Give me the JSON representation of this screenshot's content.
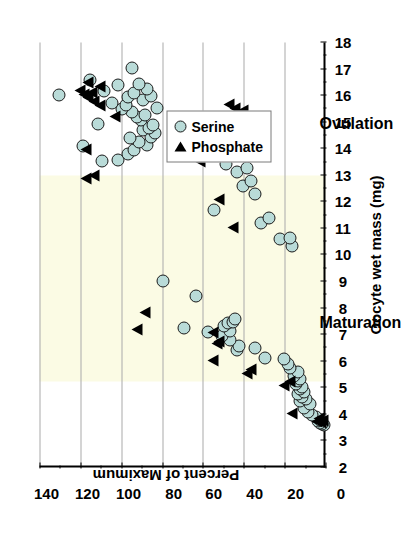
{
  "chart_data": {
    "type": "scatter",
    "title": "",
    "xlabel": "Oocyte wet mass (mg)",
    "ylabel": "Percent of Maximum",
    "xlim": [
      2,
      18
    ],
    "ylim": [
      0,
      140
    ],
    "xticks": [
      2,
      3,
      4,
      5,
      6,
      7,
      8,
      9,
      10,
      11,
      12,
      13,
      14,
      15,
      16,
      17,
      18
    ],
    "yticks": [
      0,
      20,
      40,
      60,
      80,
      100,
      120,
      140
    ],
    "xtick_labels": [
      "2",
      "3",
      "4",
      "5",
      "6",
      "7",
      "8",
      "9",
      "10",
      "11",
      "12",
      "13",
      "14",
      "15",
      "16",
      "17",
      "18"
    ],
    "ytick_labels": [
      "0",
      "20",
      "40",
      "60",
      "80",
      "100",
      "120",
      "140"
    ],
    "grid": "y-gridlines at every 20 percent",
    "orientation": "rotated 90 degrees counter-clockwise",
    "legend": {
      "position": "upper-right-of-plot",
      "entries": [
        {
          "name": "Serine",
          "marker": "circle",
          "color": "#b9dbd8",
          "edge": "#1b1b1b"
        },
        {
          "name": "Phosphate",
          "marker": "triangle",
          "color": "#000000",
          "edge": "#000000"
        }
      ]
    },
    "shaded_bands": [
      {
        "label": "Maturation",
        "x_from": 5.25,
        "x_to": 13.0,
        "color": "#fbfbe4"
      },
      {
        "label": "Ovulation",
        "x_from": 13.0,
        "x_to": 18.0,
        "color": "#ffffff"
      }
    ],
    "annotations": [
      {
        "text": "Maturation",
        "x": 7.8
      },
      {
        "text": "Ovulation",
        "x": 15.3
      }
    ],
    "series": [
      {
        "name": "Serine",
        "points": [
          [
            3.55,
            1
          ],
          [
            3.6,
            2
          ],
          [
            3.62,
            3
          ],
          [
            3.7,
            4
          ],
          [
            3.75,
            3
          ],
          [
            3.85,
            5
          ],
          [
            3.95,
            7
          ],
          [
            4.05,
            9
          ],
          [
            4.2,
            11
          ],
          [
            4.35,
            8
          ],
          [
            4.45,
            13
          ],
          [
            4.55,
            10
          ],
          [
            4.62,
            12
          ],
          [
            4.72,
            14
          ],
          [
            4.8,
            11
          ],
          [
            4.9,
            13
          ],
          [
            5.0,
            12
          ],
          [
            5.1,
            15
          ],
          [
            5.2,
            14
          ],
          [
            5.3,
            13
          ],
          [
            5.4,
            16
          ],
          [
            5.55,
            14
          ],
          [
            5.7,
            18
          ],
          [
            5.85,
            19
          ],
          [
            6.05,
            21
          ],
          [
            6.1,
            30
          ],
          [
            6.45,
            35
          ],
          [
            6.4,
            44
          ],
          [
            6.55,
            43
          ],
          [
            6.75,
            47
          ],
          [
            6.9,
            51
          ],
          [
            7.05,
            58
          ],
          [
            7.1,
            47
          ],
          [
            7.2,
            70
          ],
          [
            7.3,
            50
          ],
          [
            7.4,
            48
          ],
          [
            7.45,
            46
          ],
          [
            7.55,
            45
          ],
          [
            8.4,
            64
          ],
          [
            9.0,
            80
          ],
          [
            10.3,
            17
          ],
          [
            10.55,
            23
          ],
          [
            10.6,
            18
          ],
          [
            11.15,
            32
          ],
          [
            11.35,
            28
          ],
          [
            11.65,
            55
          ],
          [
            12.25,
            35
          ],
          [
            12.55,
            41
          ],
          [
            12.75,
            37
          ],
          [
            13.1,
            44
          ],
          [
            13.25,
            39
          ],
          [
            13.4,
            49
          ],
          [
            13.5,
            110
          ],
          [
            13.55,
            102
          ],
          [
            13.75,
            97
          ],
          [
            13.9,
            94
          ],
          [
            14.05,
            119
          ],
          [
            14.1,
            88
          ],
          [
            14.2,
            92
          ],
          [
            14.35,
            96
          ],
          [
            14.4,
            86
          ],
          [
            14.55,
            84
          ],
          [
            14.65,
            90
          ],
          [
            14.75,
            87
          ],
          [
            14.85,
            85
          ],
          [
            14.9,
            112
          ],
          [
            15.05,
            91
          ],
          [
            15.15,
            93
          ],
          [
            15.25,
            89
          ],
          [
            15.35,
            95
          ],
          [
            15.45,
            100
          ],
          [
            15.5,
            83
          ],
          [
            15.6,
            98
          ],
          [
            15.7,
            105
          ],
          [
            15.8,
            90
          ],
          [
            15.9,
            97
          ],
          [
            15.95,
            86
          ],
          [
            16.0,
            131
          ],
          [
            16.05,
            94
          ],
          [
            16.15,
            109
          ],
          [
            16.2,
            88
          ],
          [
            16.35,
            102
          ],
          [
            16.4,
            92
          ],
          [
            16.55,
            116
          ],
          [
            17.0,
            95
          ]
        ]
      },
      {
        "name": "Phosphate",
        "points": [
          [
            3.7,
            2
          ],
          [
            3.75,
            4
          ],
          [
            3.8,
            1
          ],
          [
            3.85,
            3
          ],
          [
            4.05,
            16
          ],
          [
            5.1,
            20
          ],
          [
            5.25,
            17
          ],
          [
            5.55,
            38
          ],
          [
            5.7,
            36
          ],
          [
            6.05,
            55
          ],
          [
            6.7,
            53
          ],
          [
            6.75,
            52
          ],
          [
            7.1,
            55
          ],
          [
            7.2,
            92
          ],
          [
            7.85,
            88
          ],
          [
            11.05,
            45
          ],
          [
            12.1,
            52
          ],
          [
            12.9,
            117
          ],
          [
            13.0,
            113
          ],
          [
            13.55,
            61
          ],
          [
            14.0,
            117
          ],
          [
            14.35,
            35
          ],
          [
            14.55,
            38
          ],
          [
            14.6,
            43
          ],
          [
            14.7,
            41
          ],
          [
            14.85,
            46
          ],
          [
            14.95,
            48
          ],
          [
            15.0,
            44
          ],
          [
            15.1,
            50
          ],
          [
            15.25,
            103
          ],
          [
            15.3,
            42
          ],
          [
            15.45,
            40
          ],
          [
            15.55,
            44
          ],
          [
            15.65,
            110
          ],
          [
            15.7,
            47
          ],
          [
            15.8,
            113
          ],
          [
            15.95,
            116
          ],
          [
            16.05,
            118
          ],
          [
            16.15,
            114
          ],
          [
            16.2,
            120
          ],
          [
            16.35,
            110
          ],
          [
            16.5,
            116
          ]
        ]
      }
    ]
  }
}
